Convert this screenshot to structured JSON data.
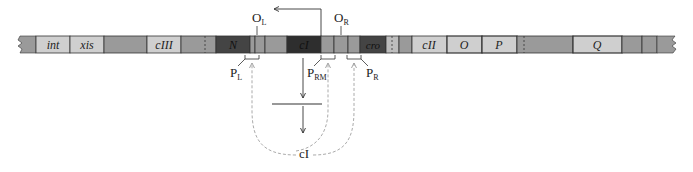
{
  "diagram": {
    "title": "",
    "colors": {
      "mid_gray": "#9a9a9a",
      "light_gray": "#cfcfcf",
      "dark": "#444444",
      "very_dark": "#2e2e2e",
      "outline": "#333333",
      "dashed_arrow": "#a0a0a0"
    },
    "genes": [
      {
        "id": "int",
        "label": "int",
        "italic": true
      },
      {
        "id": "xis",
        "label": "xis",
        "italic": true
      },
      {
        "id": "cIII",
        "label": "cIII",
        "italic": true
      },
      {
        "id": "N",
        "label": "N",
        "italic": true
      },
      {
        "id": "cI",
        "label": "cI",
        "italic": true
      },
      {
        "id": "cro",
        "label": "cro",
        "italic": true
      },
      {
        "id": "cII",
        "label": "cII",
        "italic": true
      },
      {
        "id": "O",
        "label": "O",
        "italic": true
      },
      {
        "id": "P",
        "label": "P",
        "italic": true
      },
      {
        "id": "Q",
        "label": "Q",
        "italic": true
      }
    ],
    "operators": [
      {
        "id": "OL",
        "main": "O",
        "sub": "L"
      },
      {
        "id": "OR",
        "main": "O",
        "sub": "R"
      }
    ],
    "promoters": [
      {
        "id": "PL",
        "main": "P",
        "sub": "L"
      },
      {
        "id": "PRM",
        "main": "P",
        "sub": "RM"
      },
      {
        "id": "PR",
        "main": "P",
        "sub": "R"
      }
    ],
    "repressor": {
      "label": "cI"
    }
  }
}
